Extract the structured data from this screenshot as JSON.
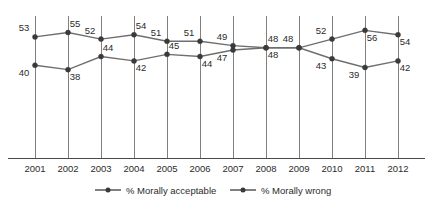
{
  "chart_data": {
    "type": "line",
    "title": "",
    "subtitle": "",
    "xlabel": "",
    "ylabel": "",
    "grid": "vertical-only",
    "legend_position": "bottom",
    "ylim": [
      36,
      58
    ],
    "categories": [
      "2001",
      "2002",
      "2003",
      "2004",
      "2005",
      "2006",
      "2007",
      "2008",
      "2009",
      "2010",
      "2011",
      "2012"
    ],
    "series": [
      {
        "name": "% Morally acceptable",
        "color": "#6e6e6e",
        "values": [
          40,
          38,
          44,
          42,
          45,
          44,
          47,
          48,
          48,
          52,
          56,
          54
        ]
      },
      {
        "name": "% Morally wrong",
        "color": "#6e6e6e",
        "values": [
          53,
          55,
          52,
          54,
          51,
          51,
          49,
          48,
          48,
          43,
          39,
          42
        ]
      }
    ]
  },
  "legend": {
    "items": [
      {
        "label": "% Morally acceptable"
      },
      {
        "label": "% Morally wrong"
      }
    ]
  },
  "axis": {
    "tick_labels": [
      "2001",
      "2002",
      "2003",
      "2004",
      "2005",
      "2006",
      "2007",
      "2008",
      "2009",
      "2010",
      "2011",
      "2012"
    ]
  }
}
